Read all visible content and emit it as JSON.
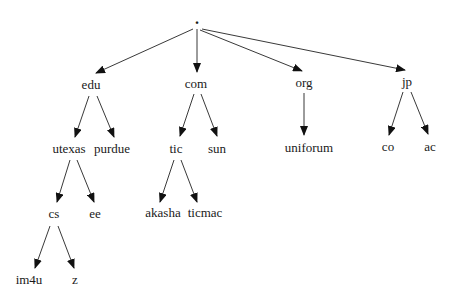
{
  "diagram": {
    "type": "tree",
    "nodes": [
      {
        "id": "root",
        "label": ".",
        "x": 197,
        "y": 19
      },
      {
        "id": "edu",
        "label": "edu",
        "x": 91,
        "y": 84
      },
      {
        "id": "com",
        "label": "com",
        "x": 196,
        "y": 83
      },
      {
        "id": "org",
        "label": "org",
        "x": 304,
        "y": 82
      },
      {
        "id": "jp",
        "label": "jp",
        "x": 407,
        "y": 81
      },
      {
        "id": "utexas",
        "label": "utexas",
        "x": 69,
        "y": 148
      },
      {
        "id": "purdue",
        "label": "purdue",
        "x": 112,
        "y": 148
      },
      {
        "id": "tic",
        "label": "tic",
        "x": 176,
        "y": 148
      },
      {
        "id": "sun",
        "label": "sun",
        "x": 217,
        "y": 148
      },
      {
        "id": "uniforum",
        "label": "uniforum",
        "x": 309,
        "y": 147
      },
      {
        "id": "co",
        "label": "co",
        "x": 388,
        "y": 146
      },
      {
        "id": "ac",
        "label": "ac",
        "x": 430,
        "y": 146
      },
      {
        "id": "cs",
        "label": "cs",
        "x": 54,
        "y": 213
      },
      {
        "id": "ee",
        "label": "ee",
        "x": 95,
        "y": 213
      },
      {
        "id": "akasha",
        "label": "akasha",
        "x": 163,
        "y": 212
      },
      {
        "id": "ticmac",
        "label": "ticmac",
        "x": 205,
        "y": 212
      },
      {
        "id": "im4u",
        "label": "im4u",
        "x": 29,
        "y": 279
      },
      {
        "id": "z",
        "label": "z",
        "x": 75,
        "y": 279
      }
    ],
    "edges": [
      {
        "from": "root",
        "to": "edu",
        "x1": 193,
        "y1": 29,
        "x2": 96,
        "y2": 73
      },
      {
        "from": "root",
        "to": "com",
        "x1": 197,
        "y1": 29,
        "x2": 197,
        "y2": 72
      },
      {
        "from": "root",
        "to": "org",
        "x1": 200,
        "y1": 30,
        "x2": 302,
        "y2": 71
      },
      {
        "from": "root",
        "to": "jp",
        "x1": 202,
        "y1": 29,
        "x2": 405,
        "y2": 70
      },
      {
        "from": "edu",
        "to": "utexas",
        "x1": 89,
        "y1": 96,
        "x2": 75,
        "y2": 137
      },
      {
        "from": "edu",
        "to": "purdue",
        "x1": 97,
        "y1": 96,
        "x2": 114,
        "y2": 137
      },
      {
        "from": "com",
        "to": "tic",
        "x1": 194,
        "y1": 94,
        "x2": 180,
        "y2": 136
      },
      {
        "from": "com",
        "to": "sun",
        "x1": 201,
        "y1": 94,
        "x2": 217,
        "y2": 136
      },
      {
        "from": "org",
        "to": "uniforum",
        "x1": 304,
        "y1": 93,
        "x2": 304,
        "y2": 135
      },
      {
        "from": "jp",
        "to": "co",
        "x1": 403,
        "y1": 92,
        "x2": 389,
        "y2": 135
      },
      {
        "from": "jp",
        "to": "ac",
        "x1": 411,
        "y1": 92,
        "x2": 428,
        "y2": 134
      },
      {
        "from": "utexas",
        "to": "cs",
        "x1": 70,
        "y1": 160,
        "x2": 57,
        "y2": 202
      },
      {
        "from": "utexas",
        "to": "ee",
        "x1": 77,
        "y1": 160,
        "x2": 94,
        "y2": 202
      },
      {
        "from": "tic",
        "to": "akasha",
        "x1": 174,
        "y1": 160,
        "x2": 160,
        "y2": 202
      },
      {
        "from": "tic",
        "to": "ticmac",
        "x1": 181,
        "y1": 160,
        "x2": 197,
        "y2": 202
      },
      {
        "from": "cs",
        "to": "im4u",
        "x1": 50,
        "y1": 226,
        "x2": 35,
        "y2": 268
      },
      {
        "from": "cs",
        "to": "z",
        "x1": 58,
        "y1": 226,
        "x2": 74,
        "y2": 268
      }
    ]
  }
}
